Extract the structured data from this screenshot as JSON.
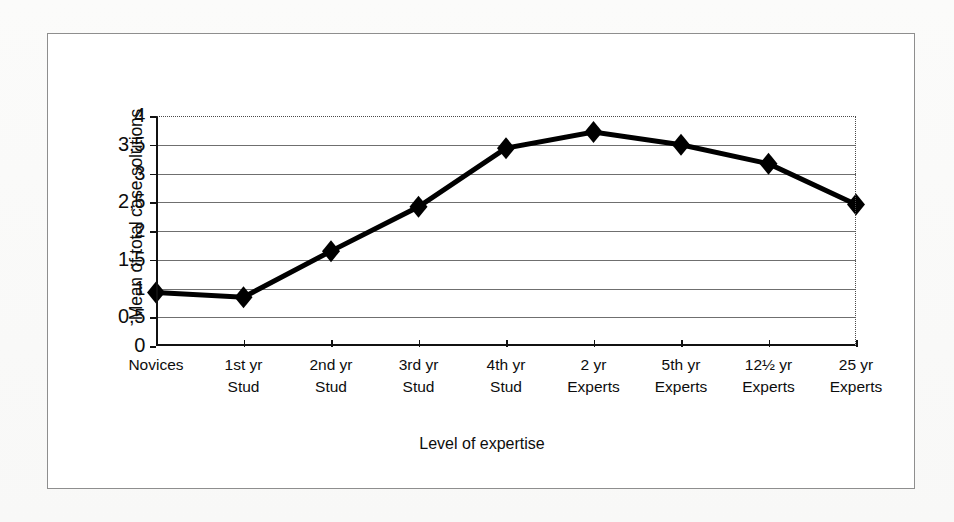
{
  "figure": {
    "background_color": "#fbfbfa",
    "frame_color": "#8e8e8e",
    "plot_background": "#ffffff"
  },
  "chart_data": {
    "type": "line",
    "title": "",
    "subtitle": "",
    "xlabel": "Level of expertise",
    "ylabel": "Mean of total case solutions",
    "categories": [
      "Novices",
      "1st yr Stud",
      "2nd yr Stud",
      "3rd yr Stud",
      "4th yr Stud",
      "2 yr Experts",
      "5th yr Experts",
      "12½ yr Experts",
      "25 yr Experts"
    ],
    "category_lines": [
      [
        "Novices",
        ""
      ],
      [
        "1st yr",
        "Stud"
      ],
      [
        "2nd yr",
        "Stud"
      ],
      [
        "3rd yr",
        "Stud"
      ],
      [
        "4th yr",
        "Stud"
      ],
      [
        "2 yr",
        "Experts"
      ],
      [
        "5th yr",
        "Experts"
      ],
      [
        "12½ yr",
        "Experts"
      ],
      [
        "25 yr",
        "Experts"
      ]
    ],
    "values": [
      0.93,
      0.85,
      1.65,
      2.42,
      3.44,
      3.72,
      3.5,
      3.17,
      2.46
    ],
    "series": [
      {
        "name": "Mean of total case solutions",
        "values": [
          0.93,
          0.85,
          1.65,
          2.42,
          3.44,
          3.72,
          3.5,
          3.17,
          2.46
        ],
        "line_color": "#000000",
        "marker": "diamond",
        "marker_color": "#000000"
      }
    ],
    "ylim": [
      0,
      4
    ],
    "ytick_labels": [
      "0",
      "0,5",
      "1",
      "1,5",
      "2",
      "2,5",
      "3",
      "3,5",
      "4"
    ],
    "ytick_values": [
      0,
      0.5,
      1,
      1.5,
      2,
      2.5,
      3,
      3.5,
      4
    ],
    "grid": true,
    "grid_axis": "y",
    "grid_color": "#6f6f6f",
    "legend": false,
    "legend_position": "none",
    "decimal_separator": ","
  }
}
